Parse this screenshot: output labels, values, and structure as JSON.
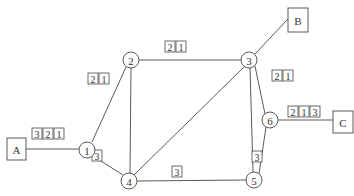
{
  "diagram": {
    "type": "network-graph",
    "terminals": [
      {
        "id": "A",
        "label": "A",
        "x": 7,
        "y": 138,
        "w": 19,
        "h": 22
      },
      {
        "id": "B",
        "label": "B",
        "x": 288,
        "y": 8,
        "w": 20,
        "h": 24
      },
      {
        "id": "C",
        "label": "C",
        "x": 333,
        "y": 111,
        "w": 20,
        "h": 22
      }
    ],
    "nodes": [
      {
        "id": "1",
        "label": "1",
        "x": 87,
        "y": 150
      },
      {
        "id": "2",
        "label": "2",
        "x": 131,
        "y": 60
      },
      {
        "id": "3",
        "label": "3",
        "x": 249,
        "y": 60
      },
      {
        "id": "4",
        "label": "4",
        "x": 129,
        "y": 181
      },
      {
        "id": "5",
        "label": "5",
        "x": 254,
        "y": 180
      },
      {
        "id": "6",
        "label": "6",
        "x": 270,
        "y": 120
      }
    ],
    "edges": [
      {
        "from": "A",
        "to": "1",
        "x1": 26,
        "y1": 149,
        "x2": 79,
        "y2": 149
      },
      {
        "from": "1",
        "to": "2",
        "x1": 92,
        "y1": 142,
        "x2": 126,
        "y2": 67
      },
      {
        "from": "1",
        "to": "4",
        "x1": 93,
        "y1": 156,
        "x2": 123,
        "y2": 175
      },
      {
        "from": "2",
        "to": "3",
        "x1": 139,
        "y1": 60,
        "x2": 241,
        "y2": 60
      },
      {
        "from": "2",
        "to": "4",
        "x1": 131,
        "y1": 68,
        "x2": 130,
        "y2": 173
      },
      {
        "from": "3",
        "to": "B",
        "x1": 255,
        "y1": 54,
        "x2": 288,
        "y2": 19
      },
      {
        "from": "3",
        "to": "4",
        "x1": 244,
        "y1": 67,
        "x2": 134,
        "y2": 175
      },
      {
        "from": "3",
        "to": "5",
        "x1": 250,
        "y1": 68,
        "x2": 253,
        "y2": 172
      },
      {
        "from": "3",
        "to": "6",
        "x1": 255,
        "y1": 66,
        "x2": 265,
        "y2": 114
      },
      {
        "from": "4",
        "to": "5",
        "x1": 137,
        "y1": 181,
        "x2": 246,
        "y2": 180
      },
      {
        "from": "5",
        "to": "6",
        "x1": 259,
        "y1": 174,
        "x2": 266,
        "y2": 127
      },
      {
        "from": "6",
        "to": "C",
        "x1": 278,
        "y1": 120,
        "x2": 333,
        "y2": 120
      }
    ],
    "tags": [
      {
        "edge": "A-1",
        "x": 32,
        "y": 128,
        "values": [
          "3",
          "2",
          "1"
        ]
      },
      {
        "edge": "1-2",
        "x": 88,
        "y": 73,
        "values": [
          "2",
          "1"
        ]
      },
      {
        "edge": "2-3",
        "x": 165,
        "y": 41,
        "values": [
          "2",
          "1"
        ]
      },
      {
        "edge": "3-6",
        "x": 272,
        "y": 70,
        "values": [
          "2",
          "1"
        ]
      },
      {
        "edge": "6-C",
        "x": 288,
        "y": 106,
        "values": [
          "2",
          "1",
          "3"
        ]
      },
      {
        "edge": "1-4",
        "x": 92,
        "y": 150,
        "values": [
          "3"
        ]
      },
      {
        "edge": "4-5",
        "x": 172,
        "y": 166,
        "values": [
          "3"
        ]
      },
      {
        "edge": "5-6",
        "x": 252,
        "y": 151,
        "values": [
          "3"
        ]
      }
    ]
  }
}
